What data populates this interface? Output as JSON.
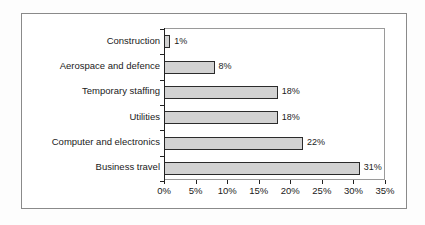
{
  "chart_data": {
    "type": "bar",
    "orientation": "horizontal",
    "title": "",
    "xlabel": "",
    "ylabel": "",
    "categories": [
      "Construction",
      "Aerospace and defence",
      "Temporary staffing",
      "Utilities",
      "Computer and electronics",
      "Business travel"
    ],
    "values": [
      1,
      8,
      18,
      18,
      22,
      31
    ],
    "data_labels": [
      "1%",
      "8%",
      "18%",
      "18%",
      "22%",
      "31%"
    ],
    "xlim": [
      0,
      35
    ],
    "xtick_values": [
      0,
      5,
      10,
      15,
      20,
      25,
      30,
      35
    ],
    "xtick_labels": [
      "0%",
      "5%",
      "10%",
      "15%",
      "20%",
      "25%",
      "30%",
      "35%"
    ],
    "grid": false,
    "legend": false,
    "bar_fill_color": "#d2d2d2",
    "bar_border_color": "#2b2b2b",
    "axis_color": "#222222",
    "background_color": "#ffffff"
  }
}
